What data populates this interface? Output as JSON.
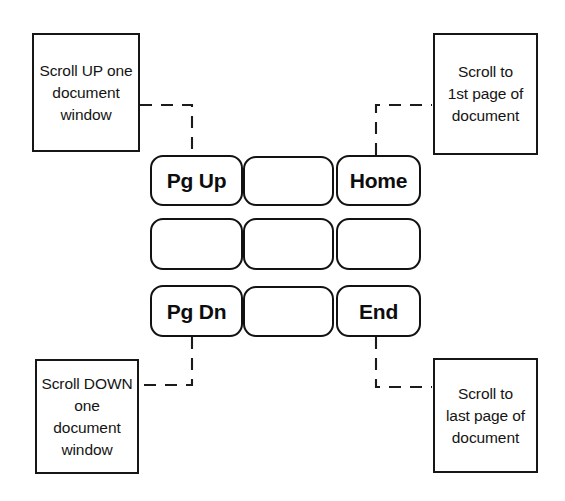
{
  "diagram": {
    "width": 565,
    "height": 501,
    "background_color": "#ffffff",
    "line_color": "#1b1b1b",
    "text_color": "#141414"
  },
  "callouts": {
    "scroll_up": {
      "text": "Scroll UP one\ndocument\nwindow",
      "target_key": "Pg Up"
    },
    "scroll_first_page": {
      "text": "Scroll to\n1st page of\ndocument",
      "target_key": "Home"
    },
    "scroll_down": {
      "text": "Scroll DOWN\none\ndocument\nwindow",
      "target_key": "Pg Dn"
    },
    "scroll_last_page": {
      "text": "Scroll to\nlast page of\ndocument",
      "target_key": "End"
    }
  },
  "keypad": {
    "rows": [
      [
        {
          "label": "Pg Up",
          "blank": false
        },
        {
          "label": "",
          "blank": true
        },
        {
          "label": "Home",
          "blank": false
        }
      ],
      [
        {
          "label": "",
          "blank": true
        },
        {
          "label": "",
          "blank": true
        },
        {
          "label": "",
          "blank": true
        }
      ],
      [
        {
          "label": "Pg Dn",
          "blank": false
        },
        {
          "label": "",
          "blank": true
        },
        {
          "label": "End",
          "blank": false
        }
      ]
    ]
  }
}
